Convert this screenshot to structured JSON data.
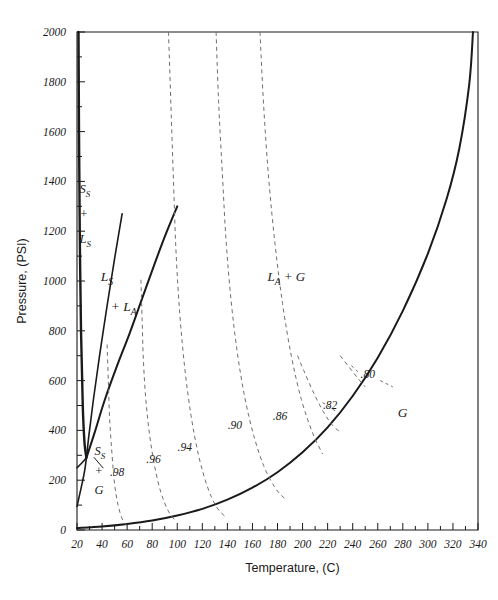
{
  "figure": {
    "name": "ammonia-water-phase-diagram",
    "background": "#ffffff",
    "line_color": "#1a1a1a",
    "dash_color": "#6e6e6e"
  },
  "chart_data": {
    "type": "line",
    "title": "",
    "xlabel": "Temperature, (C)",
    "ylabel": "Pressure, (PSI)",
    "xlim": [
      20,
      340
    ],
    "ylim": [
      0,
      2000
    ],
    "xticks": [
      20,
      40,
      60,
      80,
      100,
      120,
      140,
      160,
      180,
      200,
      220,
      240,
      260,
      280,
      300,
      320,
      340
    ],
    "xtick_labels": [
      "20",
      "40",
      "60",
      "80",
      "100",
      "120",
      "140",
      "160",
      "180",
      "200",
      "220",
      "240",
      "260",
      "280",
      "300",
      "320",
      "340"
    ],
    "xtick_minor_step": 10,
    "yticks": [
      0,
      200,
      400,
      600,
      800,
      1000,
      1200,
      1400,
      1600,
      1800,
      2000
    ],
    "ytick_labels": [
      "0",
      "200",
      "400",
      "600",
      "800",
      "1000",
      "1200",
      "1400",
      "1600",
      "1800",
      "2000"
    ],
    "ytick_minor_step": 100,
    "grid": false,
    "legend": "none",
    "region_labels": [
      {
        "id": "solid-s-plus-liquid-s",
        "text_lines": [
          "S",
          "S",
          "+",
          "L",
          "S"
        ],
        "display": "S_S + L_S",
        "x": 22.5,
        "y": 1330
      },
      {
        "id": "liquid-s-plus-liquid-a",
        "display": "L_S + L_A",
        "x": 45,
        "y": 950
      },
      {
        "id": "liquid-a-plus-gas",
        "display": "L_A + G",
        "x": 175,
        "y": 990
      },
      {
        "id": "solid-s-plus-gas",
        "display": "S_S + G",
        "x": 36,
        "y": 250
      },
      {
        "id": "gas",
        "display": "G",
        "x": 278,
        "y": 460
      }
    ],
    "series": [
      {
        "name": "solidus-Ss-Ls-boundary",
        "style": "solid",
        "width": 2.4,
        "points": [
          [
            21.2,
            2000
          ],
          [
            21.6,
            1600
          ],
          [
            22.2,
            1200
          ],
          [
            23.2,
            800
          ],
          [
            24.6,
            500
          ],
          [
            26.0,
            350
          ],
          [
            27.5,
            290
          ]
        ]
      },
      {
        "name": "Ls-La-boundary",
        "style": "solid",
        "width": 2.0,
        "points": [
          [
            27.5,
            290
          ],
          [
            34,
            390
          ],
          [
            42,
            520
          ],
          [
            52,
            660
          ],
          [
            62,
            790
          ],
          [
            72,
            930
          ],
          [
            82,
            1070
          ],
          [
            91,
            1190
          ],
          [
            100,
            1300
          ]
        ]
      },
      {
        "name": "sublimation-Ss-G-boundary",
        "style": "solid",
        "width": 1.6,
        "points": [
          [
            20,
            250
          ],
          [
            24,
            270
          ],
          [
            27.5,
            290
          ]
        ]
      },
      {
        "name": "Ss-G-lower-curve",
        "style": "solid",
        "width": 1.6,
        "points": [
          [
            20,
            95
          ],
          [
            22,
            140
          ],
          [
            24,
            185
          ],
          [
            26,
            235
          ],
          [
            27.5,
            290
          ],
          [
            29.5,
            380
          ],
          [
            33,
            520
          ],
          [
            38,
            700
          ],
          [
            44,
            900
          ],
          [
            50,
            1090
          ],
          [
            56,
            1270
          ]
        ]
      },
      {
        "name": "vaporization-saturation-curve",
        "style": "solid",
        "width": 2.0,
        "points": [
          [
            20,
            8
          ],
          [
            40,
            14
          ],
          [
            60,
            24
          ],
          [
            80,
            38
          ],
          [
            100,
            58
          ],
          [
            120,
            85
          ],
          [
            140,
            122
          ],
          [
            160,
            170
          ],
          [
            180,
            232
          ],
          [
            200,
            312
          ],
          [
            220,
            412
          ],
          [
            240,
            538
          ],
          [
            260,
            692
          ],
          [
            280,
            880
          ],
          [
            300,
            1110
          ],
          [
            315,
            1330
          ],
          [
            325,
            1530
          ],
          [
            333,
            1790
          ],
          [
            336,
            2000
          ]
        ]
      }
    ],
    "iso_concentration_lines": [
      {
        "label": ".98",
        "value": 0.98,
        "style": "dashed",
        "label_x": 52,
        "label_y": 215,
        "points": [
          [
            44,
            745
          ],
          [
            45,
            600
          ],
          [
            46,
            450
          ],
          [
            48,
            300
          ],
          [
            50,
            185
          ],
          [
            53,
            95
          ],
          [
            57,
            35
          ],
          [
            62,
            10
          ]
        ]
      },
      {
        "label": ".96",
        "value": 0.96,
        "style": "dashed",
        "label_x": 81,
        "label_y": 268,
        "points": [
          [
            71,
            1005
          ],
          [
            72,
            840
          ],
          [
            73,
            680
          ],
          [
            75,
            520
          ],
          [
            78,
            380
          ],
          [
            82,
            255
          ],
          [
            87,
            150
          ],
          [
            93,
            75
          ],
          [
            99,
            35
          ]
        ]
      },
      {
        "label": ".94",
        "value": 0.94,
        "style": "dashed",
        "label_x": 106,
        "label_y": 318,
        "points": [
          [
            93,
            2000
          ],
          [
            95,
            1700
          ],
          [
            97,
            1400
          ],
          [
            99,
            1120
          ],
          [
            102,
            870
          ],
          [
            106,
            650
          ],
          [
            111,
            460
          ],
          [
            117,
            300
          ],
          [
            124,
            175
          ],
          [
            131,
            95
          ],
          [
            138,
            55
          ]
        ]
      },
      {
        "label": ".90",
        "value": 0.9,
        "style": "dashed",
        "label_x": 146,
        "label_y": 405,
        "points": [
          [
            131,
            2000
          ],
          [
            133,
            1720
          ],
          [
            136,
            1430
          ],
          [
            139,
            1160
          ],
          [
            143,
            920
          ],
          [
            148,
            710
          ],
          [
            154,
            530
          ],
          [
            161,
            380
          ],
          [
            169,
            258
          ],
          [
            178,
            170
          ],
          [
            186,
            125
          ]
        ]
      },
      {
        "label": ".86",
        "value": 0.86,
        "style": "dashed",
        "label_x": 182,
        "label_y": 440,
        "points": [
          [
            166,
            2000
          ],
          [
            169,
            1700
          ],
          [
            173,
            1410
          ],
          [
            178,
            1150
          ],
          [
            184,
            910
          ],
          [
            191,
            700
          ],
          [
            199,
            525
          ],
          [
            208,
            390
          ],
          [
            216,
            305
          ]
        ]
      },
      {
        "label": ".82",
        "value": 0.82,
        "style": "dashed",
        "label_x": 222,
        "label_y": 485,
        "points": [
          [
            196,
            700
          ],
          [
            201,
            640
          ],
          [
            208,
            560
          ],
          [
            216,
            480
          ],
          [
            224,
            420
          ],
          [
            231,
            390
          ]
        ]
      },
      {
        "label": ".80",
        "value": 0.8,
        "style": "dashed",
        "label_x": 252,
        "label_y": 612,
        "points": [
          [
            230,
            700
          ],
          [
            237,
            655
          ],
          [
            244,
            610
          ],
          [
            250,
            575
          ]
        ]
      }
    ]
  }
}
